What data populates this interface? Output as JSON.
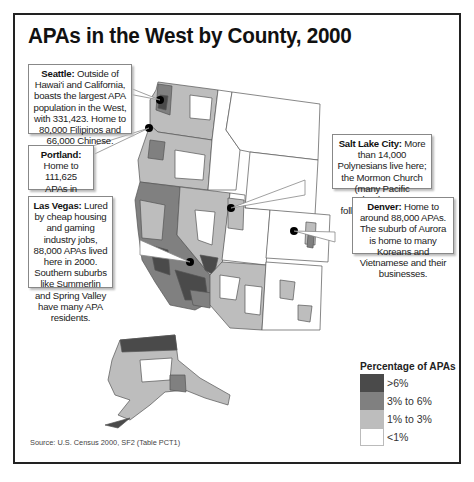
{
  "title": "APAs in the West by County, 2000",
  "callouts": [
    {
      "id": "seattle",
      "city": "Seattle:",
      "text": " Outside of Hawai'i and California, boasts the largest APA population in the West, with 331,423. Home to 80,000 Filipinos and 66,000 Chinese."
    },
    {
      "id": "portland",
      "city": "Portland:",
      "text": " Home to 111,625 APAs in 2000."
    },
    {
      "id": "lasvegas",
      "city": "Las Vegas:",
      "text": " Lured by cheap housing and gaming industry jobs, 88,000 APAs lived here in 2000. Southern suburbs like Summerlin and Spring Valley have many APA residents."
    },
    {
      "id": "saltlake",
      "city": "Salt Lake City:",
      "text": " More than 14,000 Polynesians live here; the Mormon Church (many Pacific Islanders are followers) is a factor."
    },
    {
      "id": "denver",
      "city": "Denver:",
      "text": " Home to around 88,000 APAs. The suburb of Aurora is home to many Koreans and Vietnamese and their businesses."
    }
  ],
  "legend": {
    "title": "Percentage of APAs",
    "items": [
      {
        "label": ">6%",
        "color": "#4a4a4a"
      },
      {
        "label": "3% to 6%",
        "color": "#808080"
      },
      {
        "label": "1% to 3%",
        "color": "#bdbdbd"
      },
      {
        "label": "<1%",
        "color": "#ffffff"
      }
    ]
  },
  "source": "Source: U.S. Census 2000, SF2 (Table PCT1)",
  "colors": {
    "high": "#4a4a4a",
    "mid": "#808080",
    "low": "#bdbdbd",
    "none": "#ffffff",
    "border": "#555555"
  }
}
